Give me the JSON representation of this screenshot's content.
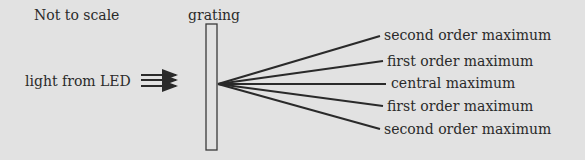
{
  "diagram": {
    "note": "Not to scale",
    "grating_label": "grating",
    "source_label": "light from LED",
    "maxima": [
      {
        "label": "second order maximum",
        "order": 2,
        "side": "upper"
      },
      {
        "label": "first order maximum",
        "order": 1,
        "side": "upper"
      },
      {
        "label": "central maximum",
        "order": 0,
        "side": "center"
      },
      {
        "label": "first order maximum",
        "order": 1,
        "side": "lower"
      },
      {
        "label": "second order maximum",
        "order": 2,
        "side": "lower"
      }
    ]
  }
}
